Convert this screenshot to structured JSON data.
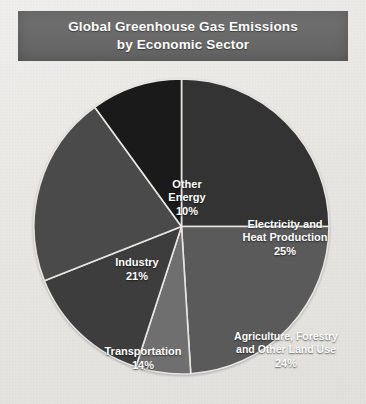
{
  "title": {
    "line1": "Global Greenhouse Gas Emissions",
    "line2": "by Economic Sector"
  },
  "colors": {
    "banner": "#6a6a6a",
    "page_background": "#eceae7",
    "label_text": "#ffffff",
    "slice_border": "#e8e6e3"
  },
  "chart_data": {
    "type": "pie",
    "title": "Global Greenhouse Gas Emissions by Economic Sector",
    "subtitle": "",
    "xlabel": "",
    "ylabel": "",
    "units": "percent",
    "total": 100,
    "start_angle_deg": 0,
    "direction": "clockwise",
    "legend_position": "none",
    "labels_inside_slices": true,
    "categories": [
      "Electricity and Heat Production",
      "Agriculture, Forestry and Other Land Use",
      "Buildings",
      "Transportation",
      "Industry",
      "Other Energy"
    ],
    "values": [
      25,
      24,
      6,
      14,
      21,
      10
    ],
    "slices": [
      {
        "name": "Electricity and Heat Production",
        "label_line1": "Electricity and",
        "label_line2": "Heat Production",
        "value": 25,
        "percent_text": "25%",
        "color": "#333333"
      },
      {
        "name": "Agriculture, Forestry and Other Land Use",
        "label_line1": "Agriculture, Forestry",
        "label_line2": "and Other Land Use",
        "value": 24,
        "percent_text": "24%",
        "color": "#5a5a5a"
      },
      {
        "name": "Buildings",
        "label_line1": "Buildings",
        "label_line2": "",
        "value": 6,
        "percent_text": "6%",
        "color": "#6f6f6f"
      },
      {
        "name": "Transportation",
        "label_line1": "Transportation",
        "label_line2": "",
        "value": 14,
        "percent_text": "14%",
        "color": "#3d3d3d"
      },
      {
        "name": "Industry",
        "label_line1": "Industry",
        "label_line2": "",
        "value": 21,
        "percent_text": "21%",
        "color": "#4a4a4a"
      },
      {
        "name": "Other Energy",
        "label_line1": "Other",
        "label_line2": "Energy",
        "value": 10,
        "percent_text": "10%",
        "color": "#1a1a1a"
      }
    ]
  }
}
